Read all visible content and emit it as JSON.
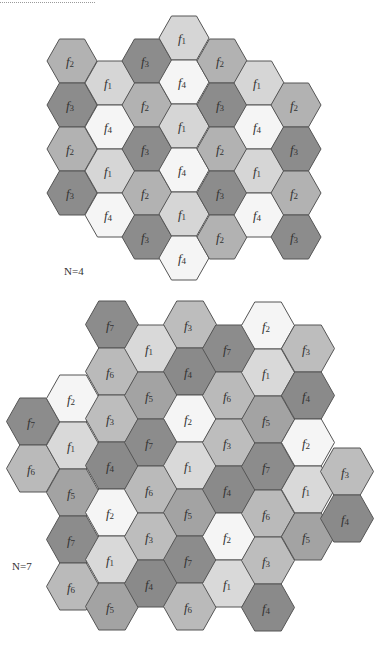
{
  "figure": {
    "diagrams": [
      {
        "id": "n4",
        "label": "N=4",
        "label_pos": {
          "x": 64,
          "y": 265
        },
        "hex_side": 25,
        "hex_height": 44,
        "colors": {
          "f1": "#d6d6d6",
          "f2": "#b2b2b2",
          "f3": "#8c8c8c",
          "f4": "#f5f5f5"
        },
        "columns": [
          {
            "cx": 72,
            "top": 39,
            "cells": [
              "f2",
              "f3",
              "f2",
              "f3"
            ]
          },
          {
            "cx": 110,
            "top": 61,
            "cells": [
              "f1",
              "f4",
              "f1",
              "f4"
            ]
          },
          {
            "cx": 147,
            "top": 39,
            "cells": [
              "f3",
              "f2",
              "f3",
              "f2",
              "f3"
            ]
          },
          {
            "cx": 184,
            "top": 16,
            "cells": [
              "f1",
              "f4",
              "f1",
              "f4",
              "f1",
              "f4"
            ]
          },
          {
            "cx": 222,
            "top": 39,
            "cells": [
              "f2",
              "f3",
              "f2",
              "f3",
              "f2"
            ]
          },
          {
            "cx": 259,
            "top": 61,
            "cells": [
              "f1",
              "f4",
              "f1",
              "f4"
            ]
          },
          {
            "cx": 296,
            "top": 83,
            "cells": [
              "f2",
              "f3",
              "f2",
              "f3"
            ]
          }
        ]
      },
      {
        "id": "n7",
        "label": "N=7",
        "label_pos": {
          "x": 12,
          "y": 560
        },
        "hex_side": 26.5,
        "hex_height": 47,
        "colors": {
          "f1": "#d9d9d9",
          "f2": "#f5f5f5",
          "f3": "#bdbdbd",
          "f4": "#8a8a8a",
          "f5": "#a3a3a3",
          "f6": "#bababa",
          "f7": "#8c8c8c"
        },
        "columns": [
          {
            "cx": 33,
            "top": 398,
            "cells": [
              "f7",
              "f6"
            ]
          },
          {
            "cx": 73,
            "top": 375,
            "cells": [
              "f2",
              "f1",
              "f5",
              "f7",
              "f6"
            ]
          },
          {
            "cx": 112,
            "top": 301,
            "cells": [
              "f7",
              "f6",
              "f3",
              "f4",
              "f2",
              "f1",
              "f5"
            ]
          },
          {
            "cx": 151,
            "top": 325,
            "cells": [
              "f1",
              "f5",
              "f7",
              "f6",
              "f3",
              "f4"
            ]
          },
          {
            "cx": 190,
            "top": 301,
            "cells": [
              "f3",
              "f4",
              "f2",
              "f1",
              "f5",
              "f7",
              "f6"
            ]
          },
          {
            "cx": 229,
            "top": 325,
            "cells": [
              "f7",
              "f6",
              "f3",
              "f4",
              "f2",
              "f1"
            ]
          },
          {
            "cx": 268,
            "top": 302,
            "cells": [
              "f2",
              "f1",
              "f5",
              "f7",
              "f6",
              "f3",
              "f4"
            ]
          },
          {
            "cx": 308,
            "top": 325,
            "cells": [
              "f3",
              "f4",
              "f2",
              "f1",
              "f5"
            ]
          },
          {
            "cx": 347,
            "top": 448,
            "cells": [
              "f3",
              "f4"
            ]
          }
        ]
      }
    ]
  }
}
